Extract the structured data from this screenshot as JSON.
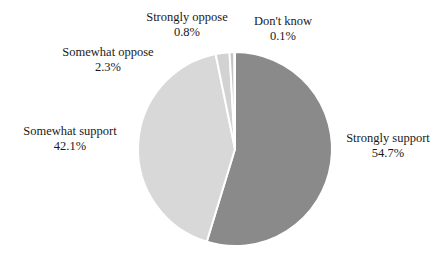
{
  "chart_data": {
    "type": "pie",
    "title": "",
    "xlabel": "",
    "ylabel": "",
    "legend_position": "external-labels",
    "grid": false,
    "categories": [
      "Strongly support",
      "Somewhat support",
      "Somewhat oppose",
      "Strongly oppose",
      "Don't know"
    ],
    "values": [
      54.7,
      42.1,
      2.3,
      0.8,
      0.1
    ],
    "value_suffix": "%",
    "slices": [
      {
        "name": "Strongly support",
        "value": 54.7,
        "value_label": "54.7%",
        "color": "#8a8a8a",
        "start_angle_deg": 0,
        "end_angle_deg": 196.92
      },
      {
        "name": "Somewhat support",
        "value": 42.1,
        "value_label": "42.1%",
        "color": "#d8d8d8",
        "start_angle_deg": 196.92,
        "end_angle_deg": 348.48
      },
      {
        "name": "Somewhat oppose",
        "value": 2.3,
        "value_label": "2.3%",
        "color": "#d2d2d2",
        "start_angle_deg": 348.48,
        "end_angle_deg": 356.76
      },
      {
        "name": "Strongly oppose",
        "value": 0.8,
        "value_label": "0.8%",
        "color": "#c4c4c4",
        "start_angle_deg": 356.76,
        "end_angle_deg": 359.64
      },
      {
        "name": "Don't know",
        "value": 0.1,
        "value_label": "0.1%",
        "color": "#9a9a9a",
        "start_angle_deg": 359.64,
        "end_angle_deg": 360
      }
    ],
    "geometry": {
      "center_x": 235,
      "center_y": 149,
      "radius": 97,
      "separator_color": "#ffffff",
      "separator_width": 2
    }
  },
  "labels": {
    "strongly_oppose": {
      "name": "Strongly oppose",
      "value": "0.8%"
    },
    "dont_know": {
      "name": "Don't know",
      "value": "0.1%"
    },
    "somewhat_oppose": {
      "name": "Somewhat oppose",
      "value": "2.3%"
    },
    "somewhat_support": {
      "name": "Somewhat support",
      "value": "42.1%"
    },
    "strongly_support": {
      "name": "Strongly support",
      "value": "54.7%"
    }
  }
}
